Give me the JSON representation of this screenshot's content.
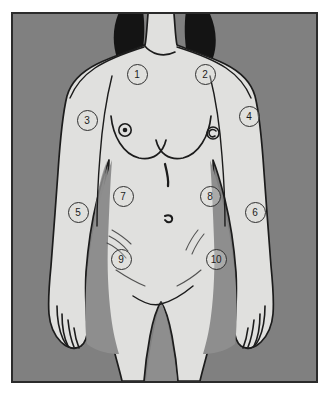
{
  "figure": {
    "view": "anterior",
    "background_color": "#808080",
    "skin_color": "#e0e0de",
    "outline_color": "#1c1c1c",
    "hair_color": "#141414",
    "shadow_color": "#8e8e8e",
    "frame_border_color": "#2b2b2b",
    "page_color": "#ffffff"
  },
  "markers": [
    {
      "id": "marker-1",
      "label": "1",
      "region": "right upper chest",
      "x": 135,
      "y": 72
    },
    {
      "id": "marker-2",
      "label": "2",
      "region": "left upper chest",
      "x": 203,
      "y": 72
    },
    {
      "id": "marker-3",
      "label": "3",
      "region": "right upper arm",
      "x": 85,
      "y": 118
    },
    {
      "id": "marker-4",
      "label": "4",
      "region": "left upper arm",
      "x": 247,
      "y": 114
    },
    {
      "id": "marker-5",
      "label": "5",
      "region": "right forearm",
      "x": 76,
      "y": 210
    },
    {
      "id": "marker-6",
      "label": "6",
      "region": "left forearm",
      "x": 253,
      "y": 210
    },
    {
      "id": "marker-7",
      "label": "7",
      "region": "right upper abdomen",
      "x": 121,
      "y": 194
    },
    {
      "id": "marker-8",
      "label": "8",
      "region": "left upper abdomen",
      "x": 208,
      "y": 194
    },
    {
      "id": "marker-9",
      "label": "9",
      "region": "right lower abdomen",
      "x": 119,
      "y": 257
    },
    {
      "id": "marker-10",
      "label": "10",
      "region": "left lower abdomen",
      "x": 214,
      "y": 257
    }
  ],
  "anatomy_features": [
    {
      "id": "nipple-right",
      "name": "right areola and nipple",
      "x": 123,
      "y": 128
    },
    {
      "id": "nipple-left",
      "name": "left areola and nipple",
      "x": 211,
      "y": 131
    },
    {
      "id": "navel",
      "name": "umbilicus",
      "x": 166,
      "y": 216
    }
  ]
}
